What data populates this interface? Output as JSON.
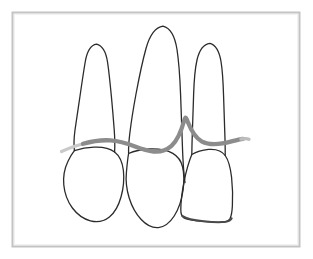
{
  "figure": {
    "title": "Dental illustration of three teeth with gingival line",
    "alt_text": "Line drawing of three anterior teeth showing roots and crowns with a gray gum line crossing them and a pointed interdental papilla between the middle and right tooth",
    "background_color": "#ffffff",
    "frame": {
      "name": "photo-border",
      "color": "#c8c8c8",
      "inner_color": "#ffffff",
      "stroke_width": 2,
      "x": 12,
      "y": 12,
      "width": 288,
      "height": 235
    },
    "line_colors": {
      "tooth_outline": "#2b2b2b",
      "gum_line": "#8a8a8a",
      "gum_line_fade": "#c5c5c5"
    },
    "stroke_widths": {
      "tooth_outline": 1.3,
      "tooth_outline_heavy": 2.0,
      "gum_line": 4.2
    },
    "elements": [
      {
        "name": "tooth-left",
        "label": "Left tooth",
        "root_apex": {
          "x": 96,
          "y": 44
        },
        "crown_center": {
          "x": 100,
          "y": 188
        }
      },
      {
        "name": "tooth-middle",
        "label": "Middle tooth",
        "root_apex": {
          "x": 163,
          "y": 26
        },
        "crown_center": {
          "x": 157,
          "y": 190
        }
      },
      {
        "name": "tooth-right",
        "label": "Right tooth",
        "root_apex": {
          "x": 210,
          "y": 43
        },
        "crown_center": {
          "x": 212,
          "y": 192
        }
      },
      {
        "name": "gum-line",
        "label": "Gingival margin line",
        "peak": {
          "x": 185,
          "y": 118
        },
        "left_end": {
          "x": 62,
          "y": 150
        },
        "right_end": {
          "x": 248,
          "y": 142
        }
      }
    ]
  }
}
